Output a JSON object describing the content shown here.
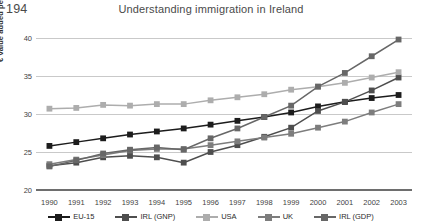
{
  "page": {
    "folio": "194",
    "running_head": "Understanding immigration in Ireland"
  },
  "chart_data": {
    "type": "line",
    "title": "",
    "xlabel": "",
    "ylabel": "€ value added per hour worked",
    "categories": [
      "1990",
      "1991",
      "1992",
      "1993",
      "1994",
      "1995",
      "1996",
      "1997",
      "1998",
      "1999",
      "2000",
      "2001",
      "2002",
      "2003"
    ],
    "x": [
      1990,
      1991,
      1992,
      1993,
      1994,
      1995,
      1996,
      1997,
      1998,
      1999,
      2000,
      2001,
      2002,
      2003
    ],
    "ylim": [
      20,
      40
    ],
    "yticks": [
      20,
      25,
      30,
      35,
      40
    ],
    "grid": true,
    "legend_position": "bottom",
    "series": [
      {
        "name": "EU-15",
        "color": "#1c1c1c",
        "values": [
          25.8,
          26.3,
          26.8,
          27.3,
          27.7,
          28.1,
          28.6,
          29.1,
          29.6,
          30.2,
          31.0,
          31.6,
          32.1,
          32.5
        ]
      },
      {
        "name": "IRL (GNP)",
        "color": "#4e4e4e",
        "values": [
          23.2,
          23.6,
          24.3,
          24.5,
          24.3,
          23.6,
          25.0,
          25.9,
          27.0,
          28.2,
          30.4,
          31.6,
          33.1,
          34.8
        ]
      },
      {
        "name": "USA",
        "color": "#adadad",
        "values": [
          30.7,
          30.8,
          31.2,
          31.1,
          31.3,
          31.3,
          31.8,
          32.2,
          32.6,
          33.2,
          33.6,
          34.1,
          34.8,
          35.5
        ]
      },
      {
        "name": "UK",
        "color": "#7d7d7d",
        "values": [
          23.4,
          24.0,
          24.6,
          25.2,
          25.4,
          25.4,
          25.9,
          26.4,
          26.9,
          27.4,
          28.2,
          29.0,
          30.2,
          31.3
        ]
      },
      {
        "name": "IRL (GDP)",
        "color": "#676767",
        "values": [
          23.1,
          23.9,
          24.8,
          25.3,
          25.6,
          25.3,
          26.8,
          28.1,
          29.6,
          31.1,
          33.6,
          35.4,
          37.6,
          39.8
        ]
      }
    ]
  }
}
